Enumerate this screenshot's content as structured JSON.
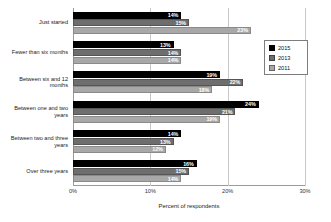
{
  "chart_data": {
    "type": "bar",
    "orientation": "horizontal",
    "title": "",
    "xlabel": "Percent of respondents",
    "ylabel": "",
    "xlim": [
      0,
      30
    ],
    "xticks": [
      "0%",
      "10%",
      "20%",
      "30%"
    ],
    "xtick_values": [
      0,
      10,
      20,
      30
    ],
    "grid": true,
    "grid_axis": "x",
    "legend_position": "upper-right-inside",
    "categories": [
      "Just started",
      "Fewer than six months",
      "Between six and 12 months",
      "Between one and two years",
      "Between two and three years",
      "Over three years"
    ],
    "series": [
      {
        "name": "2015",
        "color": "#000000",
        "values": [
          14,
          13,
          19,
          24,
          14,
          16
        ],
        "labels": [
          "14%",
          "13%",
          "19%",
          "24%",
          "14%",
          "16%"
        ]
      },
      {
        "name": "2013",
        "color": "#6e6e6e",
        "values": [
          15,
          14,
          22,
          21,
          13,
          15
        ],
        "labels": [
          "15%",
          "14%",
          "22%",
          "21%",
          "13%",
          "15%"
        ]
      },
      {
        "name": "2011",
        "color": "#a8a8a8",
        "values": [
          23,
          14,
          18,
          19,
          12,
          14
        ],
        "labels": [
          "23%",
          "14%",
          "18%",
          "19%",
          "12%",
          "14%"
        ]
      }
    ]
  }
}
